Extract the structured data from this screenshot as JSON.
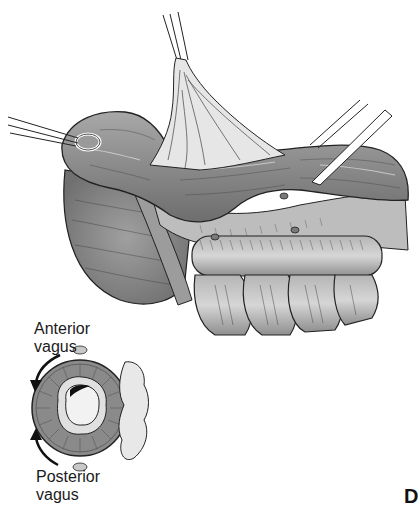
{
  "figure": {
    "labels": {
      "anterior_vagus": [
        "Anterior",
        "vagus"
      ],
      "posterior_vagus": [
        "Posterior",
        "vagus"
      ]
    },
    "panel_letter": "D"
  },
  "colors": {
    "tissue_dark": "#6e6e6e",
    "tissue_mid": "#9a9a9a",
    "tissue_light": "#c8c8c8",
    "highlight": "#e8e8e8",
    "outline": "#222222",
    "background": "#ffffff"
  }
}
